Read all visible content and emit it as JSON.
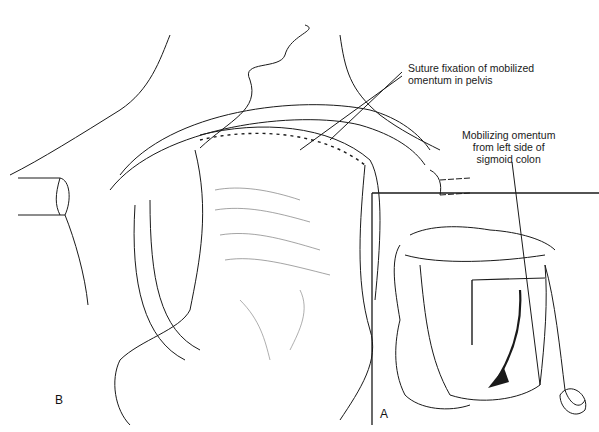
{
  "figure": {
    "panels": [
      {
        "id": "B",
        "letter": "B",
        "description": "Main operative view: mobilized omentum sutured into pelvis"
      },
      {
        "id": "A",
        "letter": "A",
        "description": "Inset: mobilizing omentum from left side of sigmoid colon"
      }
    ],
    "annotations": {
      "suture_fixation": {
        "line1": "Suture fixation of mobilized",
        "line2": "omentum in pelvis"
      },
      "mobilizing": {
        "line1": "Mobilizing omentum",
        "line2": "from left side of",
        "line3": "sigmoid colon"
      }
    },
    "colors": {
      "ink": "#1a1a1a",
      "background": "#ffffff",
      "shade": "#555555"
    }
  }
}
